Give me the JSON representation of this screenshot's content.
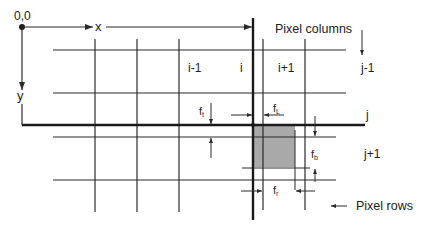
{
  "diagram": {
    "origin_label": "0,0",
    "x_axis_label": "x",
    "y_axis_label": "y",
    "column_labels": [
      "i-1",
      "i",
      "i+1"
    ],
    "row_labels": [
      "j-1",
      "j",
      "j+1"
    ],
    "pixel_columns_label": "Pixel columns",
    "pixel_rows_label": "Pixel rows",
    "fraction_labels": {
      "top": {
        "base": "f",
        "sub": "t"
      },
      "left": {
        "base": "f",
        "sub": "L"
      },
      "bottom": {
        "base": "f",
        "sub": "b"
      },
      "right": {
        "base": "f",
        "sub": "r"
      }
    },
    "colors": {
      "line": "#2a2a2a",
      "shaded_pixel": "#a9a9a9",
      "background": "#ffffff"
    }
  }
}
